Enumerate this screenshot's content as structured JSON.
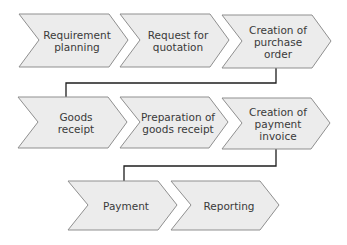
{
  "colors": {
    "chevron_fill": "#ececec",
    "chevron_stroke": "#8f8f8f",
    "connector": "#1e1e1e",
    "text": "#3a3a3a"
  },
  "rows": [
    {
      "steps": [
        {
          "label": "Requirement planning"
        },
        {
          "label": "Request for quotation"
        },
        {
          "label": "Creation of purchase order"
        }
      ]
    },
    {
      "steps": [
        {
          "label": "Goods receipt"
        },
        {
          "label": "Preparation of goods receipt"
        },
        {
          "label": "Creation of payment invoice"
        }
      ]
    },
    {
      "steps": [
        {
          "label": "Payment"
        },
        {
          "label": "Reporting"
        }
      ]
    }
  ]
}
